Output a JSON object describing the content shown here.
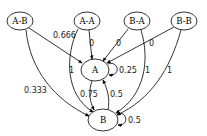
{
  "diagram": {
    "type": "directed-graph",
    "nodes": [
      {
        "id": "A-B",
        "label": "A-B"
      },
      {
        "id": "A-A",
        "label": "A-A"
      },
      {
        "id": "B-A",
        "label": "B-A"
      },
      {
        "id": "B-B",
        "label": "B-B"
      },
      {
        "id": "A",
        "label": "A"
      },
      {
        "id": "B",
        "label": "B"
      }
    ],
    "edges": [
      {
        "from": "A-B",
        "to": "A",
        "label": "0.666"
      },
      {
        "from": "A-B",
        "to": "B",
        "label": "0.333"
      },
      {
        "from": "A-A",
        "to": "A",
        "label": "0"
      },
      {
        "from": "A-A",
        "to": "B",
        "label": "1"
      },
      {
        "from": "B-A",
        "to": "A",
        "label": "0"
      },
      {
        "from": "B-A",
        "to": "B",
        "label": "1"
      },
      {
        "from": "B-B",
        "to": "A",
        "label": "0"
      },
      {
        "from": "B-B",
        "to": "B",
        "label": "1"
      },
      {
        "from": "A",
        "to": "A",
        "label": "0.25"
      },
      {
        "from": "A",
        "to": "B",
        "label": "0.75"
      },
      {
        "from": "B",
        "to": "A",
        "label": "0.5"
      },
      {
        "from": "B",
        "to": "B",
        "label": "0.5"
      }
    ]
  }
}
